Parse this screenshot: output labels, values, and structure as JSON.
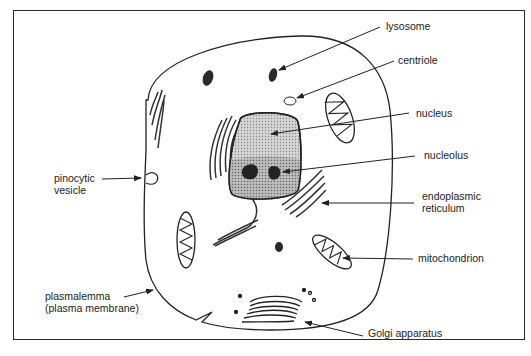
{
  "diagram": {
    "labels": {
      "lysosome": "lysosome",
      "centriole": "centriole",
      "nucleus": "nucleus",
      "nucleolus": "nucleolus",
      "pinocytic_vesicle_1": "pinocytic",
      "pinocytic_vesicle_2": "vesicle",
      "endoplasmic_reticulum_1": "endoplasmic",
      "endoplasmic_reticulum_2": "reticulum",
      "mitochondrion": "mitochondrion",
      "plasmalemma_1": "plasmalemma",
      "plasmalemma_2": "(plasma  membrane)",
      "golgi": "Golgi  apparatus"
    },
    "colors": {
      "line": "#222222",
      "nucleus_fill": "#c8c8c8",
      "nucleus_light": "#dcdcdc",
      "organelle_dark": "#2a2a2a"
    }
  }
}
